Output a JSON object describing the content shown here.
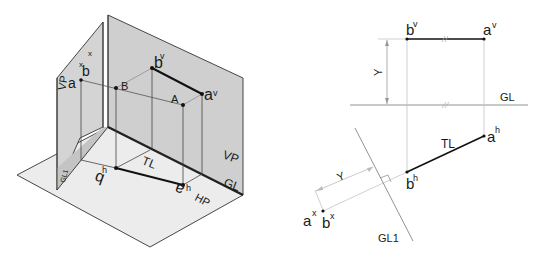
{
  "colors": {
    "plane_fill": "#cfcfcf",
    "plane_fill_light": "#e6e6e6",
    "hp_fill": "#ececec",
    "edge": "#333333",
    "line_dark": "#111111",
    "projector": "#9a9a9a",
    "construction": "#c8c8c8"
  },
  "pictorial": {
    "labels": {
      "aux_vp": "VP",
      "aux_gl": "GL1",
      "ax": "a",
      "ax_sup": "x",
      "bx": "b",
      "bx_sup": "x",
      "point_B": "B",
      "point_A": "A",
      "bv": "b",
      "bv_sup": "v",
      "av": "a",
      "av_sup": "v",
      "vp": "VP",
      "gl": "GL",
      "bh": "b",
      "bh_sup": "h",
      "ah": "a",
      "ah_sup": "h",
      "tl": "TL",
      "hp": "HP"
    }
  },
  "orthographic": {
    "labels": {
      "bv": "b",
      "bv_sup": "v",
      "av": "a",
      "av_sup": "v",
      "y_top": "Y",
      "gl": "GL",
      "ah": "a",
      "ah_sup": "h",
      "tl": "TL",
      "bh": "b",
      "bh_sup": "h",
      "y_aux": "Y",
      "ax": "a",
      "ax_sup": "x",
      "bx": "b",
      "bx_sup": "x",
      "gl1": "GL1"
    }
  }
}
